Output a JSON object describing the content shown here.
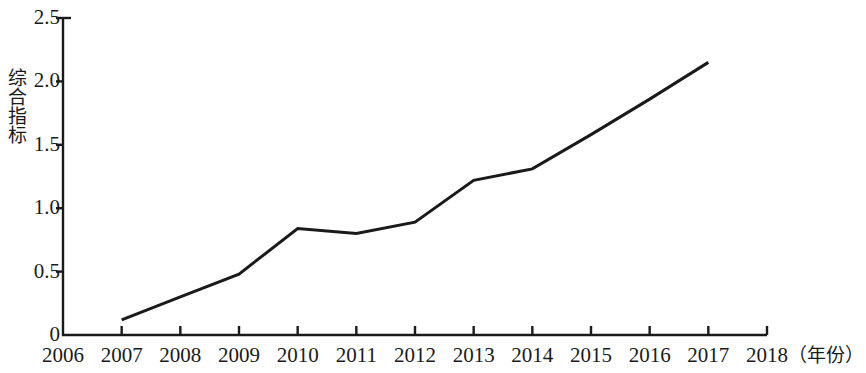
{
  "chart_data": {
    "type": "line",
    "title": "",
    "subtitle": "",
    "xlabel": "年份",
    "xlabel_display": "（年份）",
    "ylabel": "综合指标",
    "x": [
      2007,
      2008,
      2009,
      2010,
      2011,
      2012,
      2013,
      2014,
      2015,
      2016,
      2017
    ],
    "values": [
      0.12,
      0.3,
      0.48,
      0.84,
      0.8,
      0.89,
      1.22,
      1.31,
      1.58,
      1.86,
      2.15
    ],
    "series": [
      {
        "name": "综合指标",
        "values": [
          0.12,
          0.3,
          0.48,
          0.84,
          0.8,
          0.89,
          1.22,
          1.31,
          1.58,
          1.86,
          2.15
        ]
      }
    ],
    "xlim": [
      2006,
      2018
    ],
    "ylim": [
      0,
      2.5
    ],
    "x_tick_labels": [
      "2006",
      "2007",
      "2008",
      "2009",
      "2010",
      "2011",
      "2012",
      "2013",
      "2014",
      "2015",
      "2016",
      "2017",
      "2018"
    ],
    "x_tick_values": [
      2006,
      2007,
      2008,
      2009,
      2010,
      2011,
      2012,
      2013,
      2014,
      2015,
      2016,
      2017,
      2018
    ],
    "y_tick_labels": [
      "0",
      "0.5",
      "1.0",
      "1.5",
      "2.0",
      "2.5"
    ],
    "y_tick_values": [
      0,
      0.5,
      1.0,
      1.5,
      2.0,
      2.5
    ],
    "grid": false,
    "legend": false,
    "legend_position": "none",
    "line_color": "#1a1a1a",
    "line_width": 3,
    "markers": false,
    "axis_color": "#1a1a1a",
    "background_color": "#ffffff"
  },
  "axes": {
    "y_title": "综合指标",
    "x_unit_label": "（年份）"
  }
}
